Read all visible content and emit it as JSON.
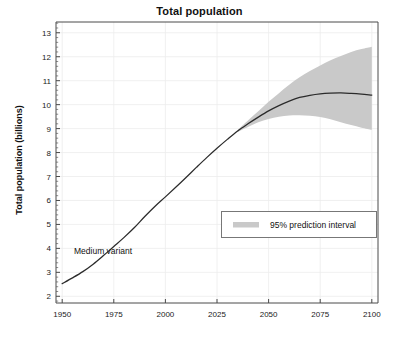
{
  "chart_data": {
    "type": "line",
    "title": "Total population",
    "xlabel": "",
    "ylabel": "Total population (billions)",
    "xlim": [
      1947,
      2103
    ],
    "ylim": [
      1.72,
      13.45
    ],
    "xticks": [
      1950,
      1975,
      2000,
      2025,
      2050,
      2075,
      2100
    ],
    "xticklabels": [
      "1950",
      "1975",
      "2000",
      "2025",
      "2050",
      "2075",
      "2100"
    ],
    "yticks": [
      2,
      3,
      4,
      5,
      6,
      7,
      8,
      9,
      10,
      11,
      12,
      13
    ],
    "yticklabels": [
      "2",
      "3",
      "4",
      "5",
      "6",
      "7",
      "8",
      "9",
      "10",
      "11",
      "12",
      "13"
    ],
    "grid": true,
    "grid_color": "#ececec",
    "minor_y_ticks": true,
    "legend": {
      "position": "center-right",
      "entries": [
        {
          "label": "95% prediction interval",
          "swatch_color": "#c9c9c9",
          "type": "band"
        }
      ]
    },
    "annotations": [
      {
        "text": "Medium variant",
        "x": 1972,
        "y": 4.25
      }
    ],
    "series": [
      {
        "name": "Medium variant",
        "type": "line",
        "color": "#2b2b2b",
        "x": [
          1950,
          1955,
          1960,
          1965,
          1970,
          1975,
          1980,
          1985,
          1990,
          1995,
          2000,
          2005,
          2010,
          2015,
          2020,
          2025,
          2030,
          2035,
          2040,
          2045,
          2050,
          2055,
          2060,
          2065,
          2070,
          2075,
          2080,
          2085,
          2090,
          2095,
          2100
        ],
        "values": [
          2.53,
          2.77,
          3.03,
          3.34,
          3.7,
          4.08,
          4.46,
          4.87,
          5.33,
          5.76,
          6.15,
          6.55,
          6.96,
          7.38,
          7.79,
          8.18,
          8.55,
          8.9,
          9.2,
          9.48,
          9.74,
          9.96,
          10.15,
          10.3,
          10.39,
          10.45,
          10.48,
          10.49,
          10.47,
          10.44,
          10.4
        ]
      },
      {
        "name": "95% prediction interval upper",
        "type": "band_upper",
        "color": "#c9c9c9",
        "x": [
          2035,
          2040,
          2045,
          2050,
          2055,
          2060,
          2065,
          2070,
          2075,
          2080,
          2085,
          2090,
          2095,
          2100
        ],
        "values": [
          8.94,
          9.34,
          9.72,
          10.12,
          10.48,
          10.83,
          11.14,
          11.4,
          11.63,
          11.85,
          12.03,
          12.2,
          12.32,
          12.42
        ]
      },
      {
        "name": "95% prediction interval lower",
        "type": "band_lower",
        "color": "#c9c9c9",
        "x": [
          2035,
          2040,
          2045,
          2050,
          2055,
          2060,
          2065,
          2070,
          2075,
          2080,
          2085,
          2090,
          2095,
          2100
        ],
        "values": [
          8.86,
          9.07,
          9.26,
          9.4,
          9.49,
          9.55,
          9.56,
          9.54,
          9.48,
          9.39,
          9.27,
          9.15,
          9.04,
          8.95
        ]
      }
    ]
  }
}
